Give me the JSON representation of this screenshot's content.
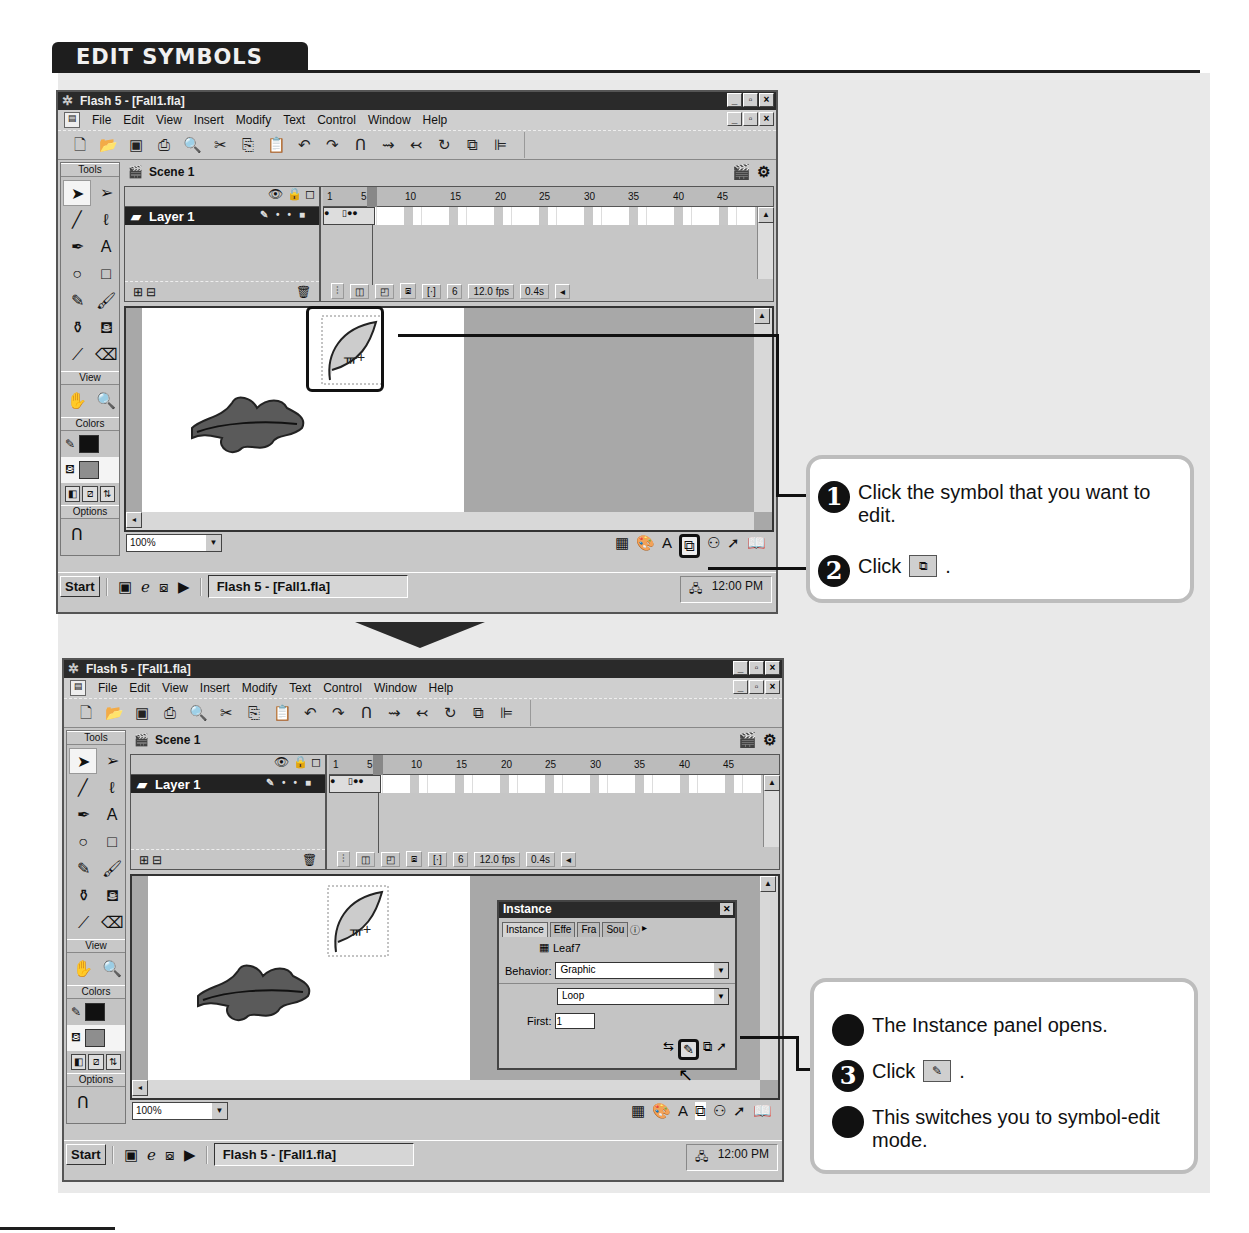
{
  "page": {
    "section_title": "EDIT SYMBOLS",
    "arrow_icon": "down-triangle"
  },
  "window": {
    "title": "Flash 5 - [Fall1.fla]",
    "title_buttons": [
      "_",
      "▫",
      "×"
    ],
    "menus": [
      "File",
      "Edit",
      "View",
      "Insert",
      "Modify",
      "Text",
      "Control",
      "Window",
      "Help"
    ],
    "toolbar_icons": [
      "new",
      "open",
      "save",
      "print",
      "print-preview",
      "cut",
      "copy",
      "paste",
      "undo",
      "redo",
      "snap",
      "smooth",
      "straighten",
      "rotate",
      "scale",
      "align"
    ],
    "scene": "Scene 1",
    "tools_panel": {
      "title": "Tools",
      "view_title": "View",
      "colors_title": "Colors",
      "options_title": "Options"
    },
    "timeline": {
      "layer_name": "Layer 1",
      "ruler_ticks": [
        "1",
        "5",
        "10",
        "15",
        "20",
        "25",
        "30",
        "35",
        "40",
        "45"
      ],
      "current_frame": "6",
      "frame_rate": "12.0 fps",
      "elapsed": "0.4s"
    },
    "zoom_level": "100%",
    "taskbar": {
      "start_label": "Start",
      "task_item": "Flash 5 - [Fall1.fla]",
      "clock": "12:00 PM"
    }
  },
  "instance_panel": {
    "title": "Instance",
    "tabs": [
      "Instance",
      "Effe",
      "Fra",
      "Sou"
    ],
    "symbol_name": "Leaf7",
    "behavior_label": "Behavior:",
    "behavior_value": "Graphic",
    "loop_value": "Loop",
    "first_label": "First:",
    "first_value": "1"
  },
  "callout_top": {
    "steps": [
      {
        "num": "1",
        "text": "Click the symbol that you want to edit."
      },
      {
        "num": "2",
        "text": "Click",
        "suffix": "."
      }
    ]
  },
  "callout_bottom": {
    "steps": [
      {
        "num": "",
        "text": "The Instance panel opens."
      },
      {
        "num": "3",
        "text": "Click",
        "suffix": "."
      },
      {
        "num": "",
        "text": "This switches you to symbol-edit mode."
      }
    ]
  }
}
